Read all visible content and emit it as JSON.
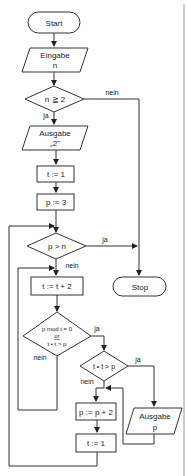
{
  "flowchart": {
    "start": "Start",
    "input_n": {
      "line1": "Eingabe",
      "line2": "n"
    },
    "cond_n_ge_2": "n ≧ 2",
    "label_nein_1": "nein",
    "label_ja_1": "ja",
    "output_2": {
      "line1": "Ausgabe",
      "line2": "„2\""
    },
    "assign_t1": "t := 1",
    "assign_p3": "p := 3",
    "cond_p_gt_n": "p > n",
    "label_ja_2": "ja",
    "label_nein_2": "nein",
    "stop": "Stop",
    "assign_t_plus2": "t := t + 2",
    "cond_mod": {
      "line1": "p mod t = 0",
      "line2": "or",
      "line3": "t • t > p"
    },
    "label_ja_3": "ja",
    "label_nein_3": "nein",
    "cond_tt_gt_p": "t • t > p",
    "label_ja_4": "ja",
    "label_nein_4": "nein",
    "assign_p_plus2": "p := p + 2",
    "output_p": {
      "line1": "Ausgabe",
      "line2": "p"
    },
    "assign_t1_b": "t := 1"
  }
}
